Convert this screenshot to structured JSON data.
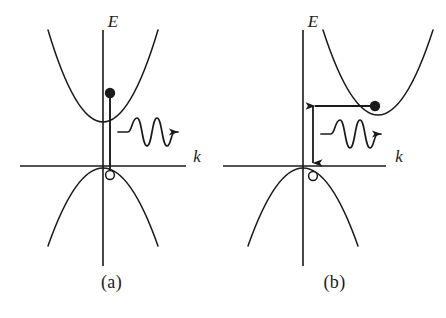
{
  "figure": {
    "background_color": "#ffffff",
    "stroke_color": "#1a1a1a",
    "width": 446,
    "height": 318
  },
  "panels": [
    {
      "id": "a",
      "caption": "(a)",
      "transition_type": "direct",
      "axes": {
        "y_label": "E",
        "x_label": "k",
        "origin": {
          "x": 103,
          "y": 166
        },
        "x_axis": {
          "x1": 20,
          "x2": 186,
          "y": 166
        },
        "y_axis": {
          "x": 103,
          "y1": 30,
          "y2": 266
        }
      },
      "conduction_band": {
        "name": "conduction-band",
        "vertex": {
          "x": 103,
          "y": 122
        },
        "half_width": 55,
        "height": 92,
        "direction": "up"
      },
      "valence_band": {
        "name": "valence-band",
        "vertex": {
          "x": 103,
          "y": 168
        },
        "half_width": 55,
        "height": 78,
        "direction": "down"
      },
      "electron": {
        "label": "electron",
        "marker": "filled-circle",
        "x": 110,
        "y": 93,
        "radius": 5.2
      },
      "hole": {
        "label": "hole",
        "marker": "open-circle",
        "x": 110,
        "y": 175,
        "radius": 4.4
      },
      "transition_arrow": {
        "label": "vertical-transition",
        "kind": "vertical-line",
        "x": 110,
        "y_start": 93,
        "y_end": 175,
        "arrowhead": "none"
      },
      "photon": {
        "label": "photon",
        "kind": "wavy-arrow",
        "direction": "right",
        "x_start": 118,
        "x_end": 182,
        "y": 132,
        "cycles": 3,
        "amplitude": 8
      }
    },
    {
      "id": "b",
      "caption": "(b)",
      "transition_type": "indirect",
      "axes": {
        "y_label": "E",
        "x_label": "k",
        "origin": {
          "x": 80,
          "y": 166
        },
        "x_axis": {
          "x1": 0,
          "x2": 163,
          "y": 166
        },
        "y_axis": {
          "x": 80,
          "y1": 30,
          "y2": 266
        }
      },
      "conduction_band": {
        "name": "conduction-band",
        "vertex": {
          "x": 155,
          "y": 115
        },
        "half_width": 55,
        "height": 88,
        "direction": "up"
      },
      "valence_band": {
        "name": "valence-band",
        "vertex": {
          "x": 80,
          "y": 168
        },
        "half_width": 55,
        "height": 78,
        "direction": "down"
      },
      "electron": {
        "label": "electron",
        "marker": "filled-circle",
        "x": 152,
        "y": 106,
        "radius": 5.2
      },
      "hole": {
        "label": "hole",
        "marker": "open-circle",
        "x": 90,
        "y": 176,
        "radius": 4.4
      },
      "transition_arrow": {
        "label": "indirect-transition",
        "kind": "elbow-arrow",
        "x_start": 148,
        "y_horizontal": 106,
        "x_corner": 90,
        "y_end": 166,
        "arrowhead_left": true,
        "arrowhead_down": true
      },
      "photon": {
        "label": "photon",
        "kind": "wavy-arrow",
        "direction": "right",
        "x_start": 98,
        "x_end": 162,
        "y": 134,
        "cycles": 3,
        "amplitude": 8
      }
    }
  ]
}
